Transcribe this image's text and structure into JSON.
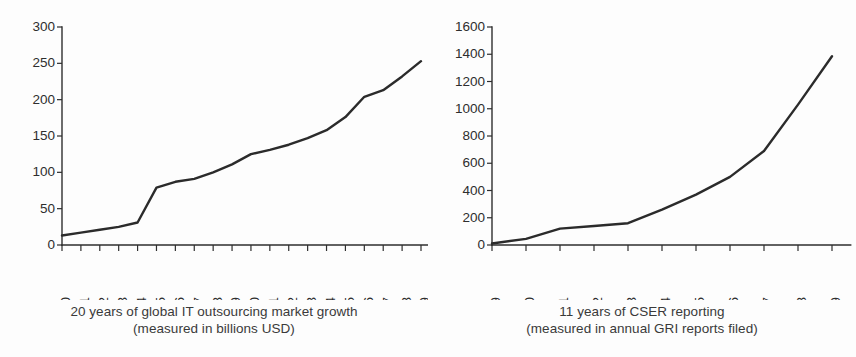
{
  "figure": {
    "background_color": "#fdfdfd",
    "line_color": "#2b2b2b",
    "text_color": "#2e2e2e"
  },
  "chart_data": [
    {
      "id": "it-outsourcing",
      "type": "line",
      "title": "",
      "caption_line1": "20 years of global IT outsourcing market growth",
      "caption_line2": "(measured in billions USD)",
      "xlabel": "",
      "ylabel": "",
      "categories": [
        "1990",
        "1991",
        "1992",
        "1993",
        "1994",
        "1995",
        "1996",
        "1997",
        "1998",
        "1999",
        "2000",
        "2001",
        "2002",
        "2003",
        "2004",
        "2005",
        "2006",
        "2007",
        "2008",
        "2009"
      ],
      "values": [
        13,
        17,
        21,
        25,
        31,
        79,
        87,
        91,
        100,
        111,
        125,
        131,
        138,
        147,
        158,
        176,
        204,
        213,
        232,
        253
      ],
      "ylim": [
        0,
        300
      ],
      "yticks": [
        0,
        50,
        100,
        150,
        200,
        250,
        300
      ],
      "ytick_labels": [
        "0",
        "50",
        "100",
        "150",
        "200",
        "250",
        "300"
      ],
      "grid": false,
      "legend": "none",
      "xtick_rotation": -90
    },
    {
      "id": "cser-reporting",
      "type": "line",
      "title": "",
      "caption_line1": "11 years of CSER reporting",
      "caption_line2": "(measured in annual GRI reports filed)",
      "xlabel": "",
      "ylabel": "",
      "categories": [
        "1999",
        "2000",
        "2001",
        "2002",
        "2003",
        "2004",
        "2005",
        "2006",
        "2007",
        "2008",
        "2009"
      ],
      "values": [
        11,
        45,
        120,
        140,
        160,
        260,
        370,
        500,
        690,
        1030,
        1385
      ],
      "ylim": [
        0,
        1600
      ],
      "yticks": [
        0,
        200,
        400,
        600,
        800,
        1000,
        1200,
        1400,
        1600
      ],
      "ytick_labels": [
        "0",
        "200",
        "400",
        "600",
        "800",
        "1000",
        "1200",
        "1400",
        "1600"
      ],
      "grid": false,
      "legend": "none",
      "xtick_rotation": -90
    }
  ]
}
